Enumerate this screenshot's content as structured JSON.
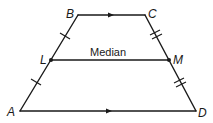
{
  "diagram": {
    "vertices": {
      "A": {
        "label": "A",
        "x": 20,
        "y": 111
      },
      "B": {
        "label": "B",
        "x": 78,
        "y": 15
      },
      "C": {
        "label": "C",
        "x": 145,
        "y": 15
      },
      "D": {
        "label": "D",
        "x": 196,
        "y": 111
      },
      "L": {
        "label": "L",
        "x": 51,
        "y": 60
      },
      "M": {
        "label": "M",
        "x": 169,
        "y": 60
      }
    },
    "segments": [
      {
        "from": "B",
        "to": "C",
        "marking": "parallel-arrow"
      },
      {
        "from": "A",
        "to": "D",
        "marking": "parallel-arrow"
      },
      {
        "from": "A",
        "to": "B",
        "marking": "single-tick-on-each-half"
      },
      {
        "from": "D",
        "to": "C",
        "marking": "double-tick-on-each-half"
      },
      {
        "from": "L",
        "to": "M",
        "marking": "none"
      }
    ],
    "median_label": "Median",
    "colors": {
      "stroke": "#1a1a1a",
      "background": "#ffffff"
    }
  }
}
